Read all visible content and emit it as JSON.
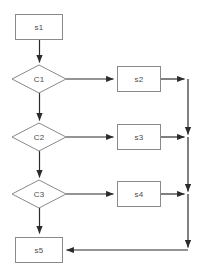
{
  "diagram": {
    "canvas": {
      "width": 202,
      "height": 270,
      "background": "#ffffff"
    },
    "style": {
      "shape_fill": "#ffffff",
      "shape_stroke": "#8a8a8a",
      "connector_color": "#2b2b2b",
      "label_color": "#4a4a4a"
    },
    "nodes": [
      {
        "id": "s1",
        "label": "s1",
        "type": "process",
        "x": 15,
        "y": 14,
        "w": 48,
        "h": 26
      },
      {
        "id": "C1",
        "label": "C1",
        "type": "decision",
        "cx": 39,
        "cy": 79,
        "rx": 27,
        "ry": 14
      },
      {
        "id": "s2",
        "label": "s2",
        "type": "process",
        "x": 117,
        "y": 66,
        "w": 44,
        "h": 26
      },
      {
        "id": "C2",
        "label": "C2",
        "type": "decision",
        "cx": 39,
        "cy": 137,
        "rx": 27,
        "ry": 14
      },
      {
        "id": "s3",
        "label": "s3",
        "type": "process",
        "x": 117,
        "y": 124,
        "w": 44,
        "h": 26
      },
      {
        "id": "C3",
        "label": "C3",
        "type": "decision",
        "cx": 39,
        "cy": 194,
        "rx": 27,
        "ry": 14
      },
      {
        "id": "s4",
        "label": "s4",
        "type": "process",
        "x": 117,
        "y": 181,
        "w": 44,
        "h": 26
      },
      {
        "id": "s5",
        "label": "s5",
        "type": "process",
        "x": 15,
        "y": 237,
        "w": 48,
        "h": 26
      }
    ],
    "edges": [
      {
        "id": "e-s1-c1",
        "from": "s1",
        "to": "C1",
        "direction": "down",
        "label": ""
      },
      {
        "id": "e-c1-s2",
        "from": "C1",
        "to": "s2",
        "direction": "right",
        "label": ""
      },
      {
        "id": "e-c1-c2",
        "from": "C1",
        "to": "C2",
        "direction": "down",
        "label": ""
      },
      {
        "id": "e-s2-join",
        "from": "s2",
        "to": "join-bus",
        "direction": "right",
        "label": ""
      },
      {
        "id": "e-c2-s3",
        "from": "C2",
        "to": "s3",
        "direction": "right",
        "label": ""
      },
      {
        "id": "e-c2-c3",
        "from": "C2",
        "to": "C3",
        "direction": "down",
        "label": ""
      },
      {
        "id": "e-s3-join",
        "from": "s3",
        "to": "join-bus",
        "direction": "right",
        "label": ""
      },
      {
        "id": "e-c3-s4",
        "from": "C3",
        "to": "s4",
        "direction": "right",
        "label": ""
      },
      {
        "id": "e-c3-s5",
        "from": "C3",
        "to": "s5",
        "direction": "down",
        "label": ""
      },
      {
        "id": "e-s4-join",
        "from": "s4",
        "to": "join-bus",
        "direction": "right",
        "label": ""
      },
      {
        "id": "e-join-s5",
        "from": "join-bus",
        "to": "s5",
        "direction": "left",
        "label": ""
      }
    ],
    "bus": {
      "id": "join-bus",
      "x": 188,
      "y_top": 79,
      "y_bottom": 250
    }
  }
}
